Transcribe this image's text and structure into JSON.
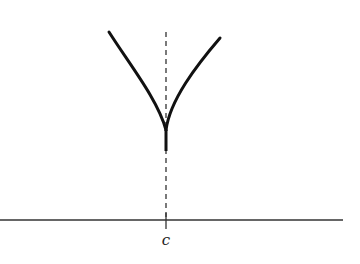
{
  "figure": {
    "axis": {
      "x1": 0,
      "x2": 343,
      "y": 220,
      "color": "#333333"
    },
    "tick": {
      "x": 166,
      "y1": 213,
      "y2": 229,
      "label": "c"
    },
    "dashed_line": {
      "x": 166,
      "y1": 32,
      "y2": 220,
      "dash": "5,4",
      "color": "#333333"
    },
    "curve": {
      "left_path": "M109,32 C130,65 158,100 166,130",
      "right_path": "M220,38 C196,66 170,100 166,130",
      "stem_path": "M166,130 L166,151",
      "color": "#111111",
      "stroke_width": 3
    }
  }
}
